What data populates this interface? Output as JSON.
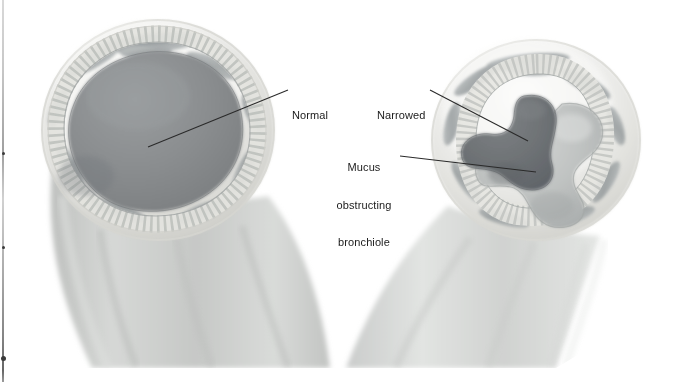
{
  "figure": {
    "kind": "medical-illustration",
    "style": "grayscale-airbrush",
    "background_color": "#ffffff"
  },
  "labels": [
    {
      "id": "normal",
      "name": "label-normal",
      "text": "Normal",
      "lines": [
        "Normal"
      ],
      "align": "left",
      "x": 292,
      "y": 84,
      "leader": {
        "x1": 288,
        "y1": 90,
        "x2": 148,
        "y2": 147
      }
    },
    {
      "id": "narrowed",
      "name": "label-narrowed",
      "text": "Narrowed",
      "lines": [
        "Narrowed"
      ],
      "align": "left",
      "x": 377,
      "y": 84,
      "leader": {
        "x1": 430,
        "y1": 90,
        "x2": 528,
        "y2": 141
      }
    },
    {
      "id": "mucus",
      "name": "label-mucus-obstructing-bronchiole",
      "text": "Mucus obstructing bronchiole",
      "lines": [
        "Mucus",
        "obstructing",
        "bronchiole"
      ],
      "align": "center",
      "x": 330,
      "y": 136,
      "leader": {
        "x1": 400,
        "y1": 156,
        "x2": 536,
        "y2": 172
      }
    }
  ],
  "parts": [
    {
      "name": "normal-bronchiole-cross-section",
      "side": "left",
      "lumen_label": "Normal",
      "lumen_color": "#8b8e90",
      "wall_color": "#e9e9e6",
      "muscle_color": "#9aa0a2"
    },
    {
      "name": "narrowed-bronchiole-cross-section",
      "side": "right",
      "lumen_label": "Narrowed",
      "lumen_color": "#6e7275",
      "mucus_color": "#b9bcbc",
      "wall_color": "#ebebe8",
      "muscle_color": "#9aa0a2"
    },
    {
      "name": "bronchiole-tube-shaft-left",
      "side": "left",
      "tube_color": "#c9cbc9"
    },
    {
      "name": "bronchiole-tube-shaft-right",
      "side": "right",
      "tube_color": "#d4d6d4"
    }
  ],
  "artifacts": {
    "scan_edge_bar": {
      "name": "scan-edge-artifact",
      "x": 2,
      "width": 2
    },
    "flecks": [
      {
        "x": 2,
        "y": 152,
        "size": 3
      },
      {
        "x": 2,
        "y": 246,
        "size": 3
      },
      {
        "x": 1,
        "y": 356,
        "size": 5
      }
    ]
  },
  "colors": {
    "ink": "#1b1b1b",
    "leader_line": "#2a2a2a",
    "paper": "#ffffff"
  }
}
